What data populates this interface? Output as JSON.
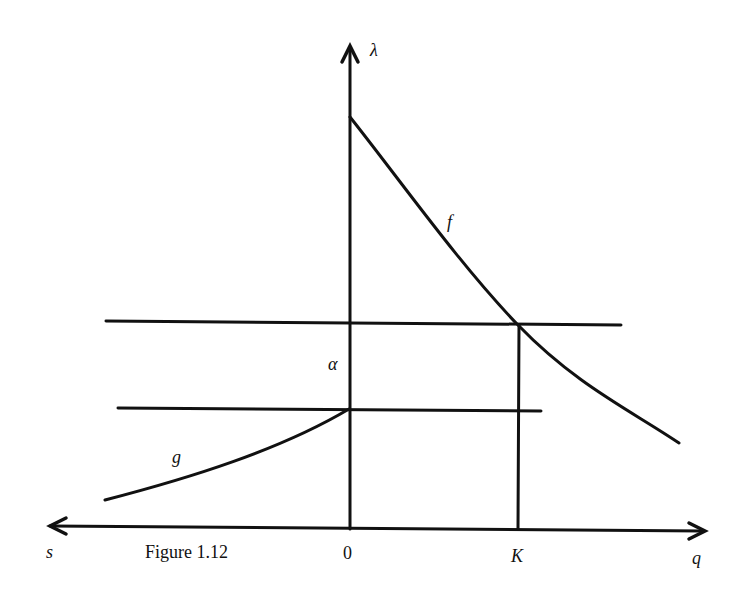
{
  "figure": {
    "caption": "Figure 1.12",
    "axes": {
      "vertical_label": "λ",
      "left_label": "s",
      "right_label": "q",
      "origin_label": "0",
      "tick_label": "K"
    },
    "curves": {
      "upper_curve_label": "f",
      "lower_curve_label": "g"
    },
    "gap_label": "α",
    "colors": {
      "ink": "#111111",
      "background": "#ffffff"
    }
  }
}
